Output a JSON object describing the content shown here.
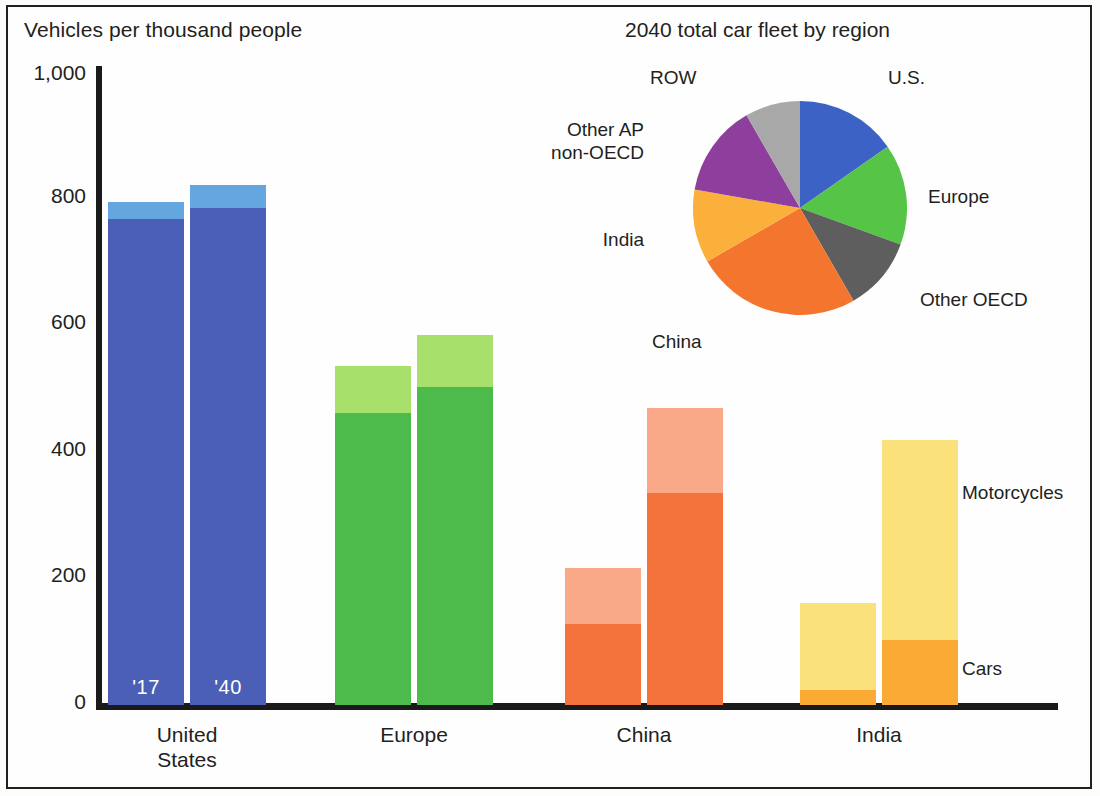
{
  "figure": {
    "bar_axis_title": "Vehicles per thousand people",
    "pie_title": "2040 total car fleet by region",
    "series_labels": {
      "top": "Motorcycles",
      "bottom": "Cars"
    },
    "year_labels": {
      "first": "'17",
      "second": "'40"
    }
  },
  "chart_data": [
    {
      "type": "bar",
      "title": "Vehicles per thousand people",
      "subtype": "grouped-stacked",
      "xlabel": "",
      "ylabel": "Vehicles per thousand people",
      "ylim": [
        0,
        1000
      ],
      "yticks": [
        0,
        200,
        400,
        600,
        800,
        1000
      ],
      "ytick_labels": [
        "0",
        "200",
        "400",
        "600",
        "800",
        "1,000"
      ],
      "grid": false,
      "legend_position": "right",
      "categories": [
        "United States",
        "Europe",
        "China",
        "India"
      ],
      "group_labels": [
        "'17",
        "'40"
      ],
      "stack_order": [
        "Cars",
        "Motorcycles"
      ],
      "series": [
        {
          "name": "Cars",
          "values": [
            {
              "category": "United States",
              "year": "'17",
              "value": 769
            },
            {
              "category": "United States",
              "year": "'40",
              "value": 786
            },
            {
              "category": "Europe",
              "year": "'17",
              "value": 462
            },
            {
              "category": "Europe",
              "year": "'40",
              "value": 503
            },
            {
              "category": "China",
              "year": "'17",
              "value": 128
            },
            {
              "category": "China",
              "year": "'40",
              "value": 335
            },
            {
              "category": "India",
              "year": "'17",
              "value": 24
            },
            {
              "category": "India",
              "year": "'40",
              "value": 103
            }
          ]
        },
        {
          "name": "Motorcycles",
          "values": [
            {
              "category": "United States",
              "year": "'17",
              "value": 27
            },
            {
              "category": "United States",
              "year": "'40",
              "value": 36
            },
            {
              "category": "Europe",
              "year": "'17",
              "value": 74
            },
            {
              "category": "Europe",
              "year": "'40",
              "value": 82
            },
            {
              "category": "China",
              "year": "'17",
              "value": 89
            },
            {
              "category": "China",
              "year": "'40",
              "value": 135
            },
            {
              "category": "India",
              "year": "'17",
              "value": 137
            },
            {
              "category": "India",
              "year": "'40",
              "value": 316
            }
          ]
        }
      ],
      "totals": [
        {
          "category": "United States",
          "year": "'17",
          "value": 796
        },
        {
          "category": "United States",
          "year": "'40",
          "value": 822
        },
        {
          "category": "Europe",
          "year": "'17",
          "value": 536
        },
        {
          "category": "Europe",
          "year": "'40",
          "value": 585
        },
        {
          "category": "China",
          "year": "'17",
          "value": 217
        },
        {
          "category": "China",
          "year": "'40",
          "value": 470
        },
        {
          "category": "India",
          "year": "'17",
          "value": 161
        },
        {
          "category": "India",
          "year": "'40",
          "value": 419
        }
      ],
      "colors": {
        "United States": {
          "cars": "#4a5fb5",
          "motorcycles": "#63a6e0"
        },
        "Europe": {
          "cars": "#4cbb4c",
          "motorcycles": "#a7e06a"
        },
        "China": {
          "cars": "#f4733c",
          "motorcycles": "#f9a987"
        },
        "India": {
          "cars": "#fbaa33",
          "motorcycles": "#fbe17c"
        }
      }
    },
    {
      "type": "pie",
      "title": "2040 total car fleet by region",
      "labels": [
        "U.S.",
        "Europe",
        "Other OECD",
        "China",
        "India",
        "Other AP non-OECD",
        "ROW"
      ],
      "values": [
        15.3,
        15.3,
        11.1,
        25.0,
        11.1,
        13.9,
        8.3
      ],
      "start_angle_deg": 0,
      "direction": "clockwise",
      "colors": [
        "#3b62c4",
        "#55c447",
        "#5e5e5e",
        "#f4752e",
        "#fbb03b",
        "#8e3f9e",
        "#a8a8a8"
      ],
      "legend_position": "around"
    }
  ],
  "axis": {
    "yticks": [
      {
        "label": "1,000",
        "top": 61
      },
      {
        "label": "800",
        "top": 184
      },
      {
        "label": "600",
        "top": 310
      },
      {
        "label": "400",
        "top": 437
      },
      {
        "label": "200",
        "top": 563
      },
      {
        "label": "0",
        "top": 690
      }
    ]
  },
  "bars": [
    {
      "name": "united-states-2017",
      "category": "United States",
      "year": "'17",
      "left": 108,
      "width": 76,
      "cars": 769,
      "motorcycles": 27,
      "color_cars": "#4a5fb5",
      "color_moto": "#63a6e0",
      "show_year": true
    },
    {
      "name": "united-states-2040",
      "category": "United States",
      "year": "'40",
      "left": 190,
      "width": 76,
      "cars": 786,
      "motorcycles": 36,
      "color_cars": "#4a5fb5",
      "color_moto": "#63a6e0",
      "show_year": true
    },
    {
      "name": "europe-2017",
      "category": "Europe",
      "year": "'17",
      "left": 335,
      "width": 76,
      "cars": 462,
      "motorcycles": 74,
      "color_cars": "#4cbb4c",
      "color_moto": "#a7e06a",
      "show_year": false
    },
    {
      "name": "europe-2040",
      "category": "Europe",
      "year": "'40",
      "left": 417,
      "width": 76,
      "cars": 503,
      "motorcycles": 82,
      "color_cars": "#4cbb4c",
      "color_moto": "#a7e06a",
      "show_year": false
    },
    {
      "name": "china-2017",
      "category": "China",
      "year": "'17",
      "left": 565,
      "width": 76,
      "cars": 128,
      "motorcycles": 89,
      "color_cars": "#f4733c",
      "color_moto": "#f9a987",
      "show_year": false
    },
    {
      "name": "china-2040",
      "category": "China",
      "year": "'40",
      "left": 647,
      "width": 76,
      "cars": 335,
      "motorcycles": 135,
      "color_cars": "#f4733c",
      "color_moto": "#f9a987",
      "show_year": false
    },
    {
      "name": "india-2017",
      "category": "India",
      "year": "'17",
      "left": 800,
      "width": 76,
      "cars": 24,
      "motorcycles": 137,
      "color_cars": "#fbaa33",
      "color_moto": "#fbe17c",
      "show_year": false
    },
    {
      "name": "india-2040",
      "category": "India",
      "year": "'40",
      "left": 882,
      "width": 76,
      "cars": 103,
      "motorcycles": 316,
      "color_cars": "#fbaa33",
      "color_moto": "#fbe17c",
      "show_year": false
    }
  ],
  "category_labels": [
    {
      "name": "united-states",
      "text": "United\nStates",
      "left": 108,
      "width": 158
    },
    {
      "name": "europe",
      "text": "Europe",
      "left": 335,
      "width": 158
    },
    {
      "name": "china",
      "text": "China",
      "left": 565,
      "width": 158
    },
    {
      "name": "india",
      "text": "India",
      "left": 800,
      "width": 158
    }
  ],
  "side_labels": [
    {
      "name": "motorcycles",
      "text": "Motorcycles",
      "left": 962,
      "top": 482
    },
    {
      "name": "cars",
      "text": "Cars",
      "left": 962,
      "top": 658
    }
  ],
  "pie": {
    "cx": 107,
    "cy": 107,
    "r": 107,
    "slices": [
      {
        "name": "us",
        "label": "U.S.",
        "value": 15.3,
        "start": 0,
        "end": 55,
        "color": "#3b62c4"
      },
      {
        "name": "europe",
        "label": "Europe",
        "value": 15.3,
        "start": 55,
        "end": 110,
        "color": "#55c447"
      },
      {
        "name": "other-oecd",
        "label": "Other OECD",
        "value": 11.1,
        "start": 110,
        "end": 150,
        "color": "#5e5e5e"
      },
      {
        "name": "china",
        "label": "China",
        "value": 25.0,
        "start": 150,
        "end": 240,
        "color": "#f4752e"
      },
      {
        "name": "india",
        "label": "India",
        "value": 11.1,
        "start": 240,
        "end": 280,
        "color": "#fbb03b"
      },
      {
        "name": "other-ap-non-oecd",
        "label": "Other AP non-OECD",
        "value": 13.9,
        "start": 280,
        "end": 330,
        "color": "#8e3f9e"
      },
      {
        "name": "row",
        "label": "ROW",
        "value": 8.3,
        "start": 330,
        "end": 360,
        "color": "#a8a8a8"
      }
    ],
    "labels": [
      {
        "name": "row",
        "text": "ROW",
        "left": 650,
        "top": 66,
        "align": "left"
      },
      {
        "name": "us",
        "text": "U.S.",
        "left": 888,
        "top": 66,
        "align": "left"
      },
      {
        "name": "other-ap-non-oecd",
        "text": "Other AP\nnon-OECD",
        "left": 528,
        "top": 118,
        "align": "right",
        "width": 116
      },
      {
        "name": "europe",
        "text": "Europe",
        "left": 928,
        "top": 185,
        "align": "left"
      },
      {
        "name": "india",
        "text": "India",
        "left": 578,
        "top": 228,
        "align": "right",
        "width": 66
      },
      {
        "name": "other-oecd",
        "text": "Other OECD",
        "left": 920,
        "top": 288,
        "align": "left"
      },
      {
        "name": "china",
        "text": "China",
        "left": 652,
        "top": 330,
        "align": "left"
      }
    ]
  }
}
